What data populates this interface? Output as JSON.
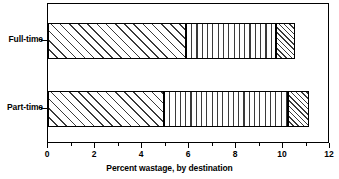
{
  "chart_data": {
    "type": "bar",
    "orientation": "horizontal",
    "stacked": true,
    "title": "",
    "xlabel": "Percent wastage, by destination",
    "ylabel": "",
    "xlim": [
      0,
      12
    ],
    "xticks": [
      0,
      1,
      2,
      3,
      4,
      5,
      6,
      7,
      8,
      9,
      10,
      11,
      12
    ],
    "xtick_labels": [
      "0",
      "",
      "2",
      "",
      "4",
      "",
      "6",
      "",
      "8",
      "",
      "10",
      "",
      "12"
    ],
    "major_xticks": [
      0,
      2,
      4,
      6,
      8,
      10,
      12
    ],
    "minor_xticks": [
      1,
      3,
      5,
      7,
      9,
      11
    ],
    "grid": false,
    "legend": "none",
    "categories": [
      "Full-time",
      "Part-time"
    ],
    "series": [
      {
        "name": "segment-1",
        "pattern": "diagonal-hatch-wide",
        "values": [
          5.85,
          4.95
        ]
      },
      {
        "name": "segment-2",
        "pattern": "vertical-hatch",
        "values": [
          3.85,
          5.25
        ]
      },
      {
        "name": "segment-3",
        "pattern": "diagonal-hatch-dense",
        "values": [
          0.8,
          0.9
        ]
      }
    ],
    "cumulative_values": {
      "Full-time": [
        5.85,
        9.7,
        10.5
      ],
      "Part-time": [
        4.95,
        10.2,
        11.1
      ]
    },
    "totals": [
      10.5,
      11.1
    ],
    "colors": {
      "frame": "#000000",
      "hatch": "#3a3a3a",
      "background": "#ffffff"
    }
  },
  "axis": {
    "title": "Percent wastage, by destination",
    "tick_labels": [
      {
        "value": 0,
        "label": "0"
      },
      {
        "value": 2,
        "label": "2"
      },
      {
        "value": 4,
        "label": "4"
      },
      {
        "value": 6,
        "label": "6"
      },
      {
        "value": 8,
        "label": "8"
      },
      {
        "value": 10,
        "label": "10"
      },
      {
        "value": 12,
        "label": "12"
      }
    ]
  },
  "categories": {
    "fulltime": "Full-time",
    "parttime": "Part-time"
  }
}
